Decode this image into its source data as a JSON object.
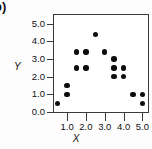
{
  "figure": {
    "panel_letter": "b)",
    "background_color": "#fdfdfd",
    "frame_color": "#3a3a3a",
    "marker_color": "#0d0d0d"
  },
  "chart_data": {
    "type": "scatter",
    "title": "",
    "xlabel": "X",
    "ylabel": "Y",
    "xlim": [
      0.25,
      5.35
    ],
    "ylim": [
      -0.05,
      5.55
    ],
    "xticks": [
      1.0,
      2.0,
      3.0,
      4.0,
      5.0
    ],
    "xtick_labels": [
      "1.0",
      "2.0",
      "3.0",
      "4.0",
      "5.0"
    ],
    "yticks": [
      0.0,
      1.0,
      2.0,
      3.0,
      4.0,
      5.0
    ],
    "ytick_labels": [
      "0.0",
      "1.0",
      "2.0",
      "3.0",
      "4.0",
      "5.0"
    ],
    "grid": false,
    "legend": null,
    "series": [
      {
        "name": "observations",
        "marker": "filled-circle",
        "color": "#0d0d0d",
        "x": [
          0.5,
          1.0,
          1.0,
          1.5,
          1.5,
          2.0,
          2.0,
          2.5,
          3.0,
          3.5,
          3.5,
          3.5,
          4.0,
          4.0,
          4.5,
          5.0,
          5.0
        ],
        "y": [
          0.5,
          1.0,
          1.5,
          2.5,
          3.4,
          2.5,
          3.4,
          4.4,
          3.4,
          2.0,
          2.5,
          3.0,
          2.0,
          2.5,
          1.0,
          1.0,
          0.5
        ]
      }
    ]
  }
}
